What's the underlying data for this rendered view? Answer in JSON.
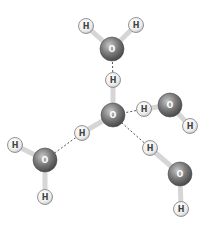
{
  "diagram": {
    "colors": {
      "oxygen_dark": "#5a5a5a",
      "oxygen_light": "#c8c8c8",
      "hydrogen_fill": "#f2f2f2",
      "hydrogen_stroke": "#8a8a8a",
      "bond": "#d6d6d6",
      "hbond": "#555555",
      "label_o": "#ffffff",
      "label_h": "#444444"
    },
    "atoms": [
      {
        "id": "O1",
        "element": "O",
        "label": "O",
        "x": 112,
        "y": 49
      },
      {
        "id": "H1a",
        "element": "H",
        "label": "H",
        "x": 86,
        "y": 26
      },
      {
        "id": "H1b",
        "element": "H",
        "label": "H",
        "x": 136,
        "y": 25
      },
      {
        "id": "O0",
        "element": "O",
        "label": "O",
        "x": 113,
        "y": 115
      },
      {
        "id": "H0a",
        "element": "H",
        "label": "H",
        "x": 113,
        "y": 80
      },
      {
        "id": "H0b",
        "element": "H",
        "label": "H",
        "x": 82,
        "y": 133
      },
      {
        "id": "O2",
        "element": "O",
        "label": "O",
        "x": 170,
        "y": 105
      },
      {
        "id": "H2a",
        "element": "H",
        "label": "H",
        "x": 144,
        "y": 109
      },
      {
        "id": "H2b",
        "element": "H",
        "label": "H",
        "x": 190,
        "y": 126
      },
      {
        "id": "O3",
        "element": "O",
        "label": "O",
        "x": 45,
        "y": 160
      },
      {
        "id": "H3a",
        "element": "H",
        "label": "H",
        "x": 15,
        "y": 145
      },
      {
        "id": "H3b",
        "element": "H",
        "label": "H",
        "x": 45,
        "y": 197
      },
      {
        "id": "O4",
        "element": "O",
        "label": "O",
        "x": 180,
        "y": 174
      },
      {
        "id": "H4a",
        "element": "H",
        "label": "H",
        "x": 150,
        "y": 148
      },
      {
        "id": "H4b",
        "element": "H",
        "label": "H",
        "x": 181,
        "y": 209
      }
    ],
    "bonds": [
      {
        "from": "O1",
        "to": "H1a"
      },
      {
        "from": "O1",
        "to": "H1b"
      },
      {
        "from": "O0",
        "to": "H0a"
      },
      {
        "from": "O0",
        "to": "H0b"
      },
      {
        "from": "O2",
        "to": "H2a"
      },
      {
        "from": "O2",
        "to": "H2b"
      },
      {
        "from": "O3",
        "to": "H3a"
      },
      {
        "from": "O3",
        "to": "H3b"
      },
      {
        "from": "O4",
        "to": "H4a"
      },
      {
        "from": "O4",
        "to": "H4b"
      }
    ],
    "hydrogen_bonds": [
      {
        "from": "H0a",
        "to": "O1"
      },
      {
        "from": "H2a",
        "to": "O0"
      },
      {
        "from": "H0b",
        "to": "O3"
      },
      {
        "from": "H4a",
        "to": "O0"
      }
    ]
  }
}
